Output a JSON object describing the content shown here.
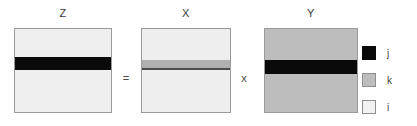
{
  "figure": {
    "type": "matrix-multiplication-diagram",
    "equation": "Z = X x Y",
    "matrices": [
      {
        "key": "z",
        "label": "Z",
        "fill_color": "#efefef",
        "fill_index": "i",
        "band_color": "#0a0a0a",
        "band_index": "j"
      },
      {
        "key": "x",
        "label": "X",
        "fill_color": "#eeeeee",
        "fill_index": "i",
        "band_color": "#b0b0b0",
        "band_index": "k"
      },
      {
        "key": "y",
        "label": "Y",
        "fill_color": "#bdbdbd",
        "fill_index": "k",
        "band_color": "#0a0a0a",
        "band_index": "j"
      }
    ],
    "operators": {
      "equals": "=",
      "times": "x"
    },
    "legend": {
      "items": [
        {
          "swatch_color": "#0a0a0a",
          "label": "j"
        },
        {
          "swatch_color": "#bdbdbd",
          "label": "k"
        },
        {
          "swatch_color": "#f2f2f2",
          "label": "i"
        }
      ]
    }
  }
}
